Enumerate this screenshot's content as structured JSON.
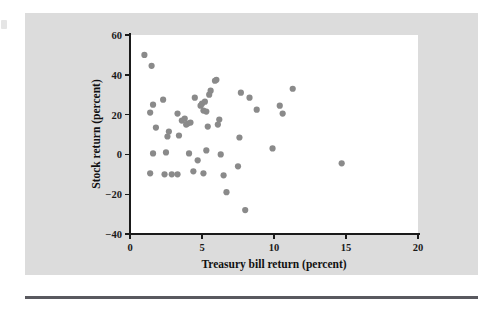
{
  "figure": {
    "background_color": "#dcdcdc",
    "plot_background_color": "#ffffff",
    "rule_color": "#59595f"
  },
  "chart_data": {
    "type": "scatter",
    "title": "",
    "xlabel": "Treasury bill return (percent)",
    "ylabel": "Stock return (percent)",
    "xlim": [
      0,
      20
    ],
    "ylim": [
      -40,
      60
    ],
    "xticks": [
      0,
      5,
      10,
      15,
      20
    ],
    "yticks": [
      -40,
      -20,
      0,
      20,
      40,
      60
    ],
    "xtick_labels": [
      "0",
      "5",
      "10",
      "15",
      "20"
    ],
    "ytick_labels": [
      "-40",
      "-20",
      "0",
      "20",
      "40",
      "60"
    ],
    "grid": false,
    "legend": null,
    "marker_color": "#8a8a8a",
    "marker_size": 3.1,
    "points": [
      [
        1.0,
        50.0
      ],
      [
        1.5,
        44.5
      ],
      [
        1.6,
        25.0
      ],
      [
        1.4,
        21.0
      ],
      [
        2.3,
        27.5
      ],
      [
        1.8,
        13.5
      ],
      [
        1.6,
        0.5
      ],
      [
        1.4,
        -9.5
      ],
      [
        2.6,
        9.0
      ],
      [
        2.7,
        11.5
      ],
      [
        2.5,
        1.0
      ],
      [
        2.4,
        -10.0
      ],
      [
        2.9,
        -10.0
      ],
      [
        3.3,
        20.5
      ],
      [
        3.4,
        9.5
      ],
      [
        3.6,
        17.0
      ],
      [
        3.8,
        18.0
      ],
      [
        3.9,
        15.0
      ],
      [
        4.0,
        15.5
      ],
      [
        4.2,
        16.0
      ],
      [
        4.1,
        0.5
      ],
      [
        3.3,
        -10.0
      ],
      [
        4.5,
        28.5
      ],
      [
        4.9,
        24.5
      ],
      [
        5.0,
        25.5
      ],
      [
        5.1,
        22.0
      ],
      [
        5.2,
        26.5
      ],
      [
        5.3,
        21.5
      ],
      [
        5.5,
        30.0
      ],
      [
        5.6,
        32.0
      ],
      [
        5.9,
        37.0
      ],
      [
        6.0,
        37.5
      ],
      [
        5.4,
        14.0
      ],
      [
        6.2,
        17.5
      ],
      [
        6.1,
        15.0
      ],
      [
        5.3,
        2.0
      ],
      [
        4.7,
        -3.0
      ],
      [
        4.4,
        -8.5
      ],
      [
        5.1,
        -9.5
      ],
      [
        6.3,
        0.0
      ],
      [
        6.5,
        -10.5
      ],
      [
        6.7,
        -19.0
      ],
      [
        7.6,
        8.5
      ],
      [
        7.7,
        31.0
      ],
      [
        7.5,
        -6.0
      ],
      [
        8.0,
        -28.0
      ],
      [
        8.3,
        28.5
      ],
      [
        8.8,
        22.5
      ],
      [
        9.9,
        3.0
      ],
      [
        10.4,
        24.5
      ],
      [
        10.6,
        20.5
      ],
      [
        11.3,
        33.0
      ],
      [
        14.7,
        -4.5
      ]
    ]
  }
}
